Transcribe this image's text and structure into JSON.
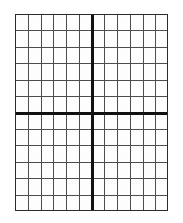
{
  "figure": {
    "kind": "blank-coordinate-grid",
    "background_color": "#ffffff",
    "plot_background_color": "#fdfdfd",
    "minor_gridline_color": "#4d4d4d",
    "axis_color": "#111111",
    "border_color": "#2b2b2b",
    "minor_gridline_width_px": 1,
    "axis_line_width_px": 2.6,
    "border_width_px": 1.4
  },
  "chart_data": {
    "type": "grid",
    "title": "",
    "subtitle": "",
    "xlabel": "",
    "ylabel": "",
    "columns": 12,
    "rows": 12,
    "xlim": [
      -6,
      6
    ],
    "ylim": [
      -6,
      6
    ],
    "x_tick_step": 1,
    "y_tick_step": 1,
    "x_ticks": [
      -6,
      -5,
      -4,
      -3,
      -2,
      -1,
      0,
      1,
      2,
      3,
      4,
      5,
      6
    ],
    "y_ticks": [
      -6,
      -5,
      -4,
      -3,
      -2,
      -1,
      0,
      1,
      2,
      3,
      4,
      5,
      6
    ],
    "x_tick_labels": [],
    "y_tick_labels": [],
    "grid": true,
    "legend": null,
    "legend_position": "none",
    "annotations": [],
    "series": [],
    "origin": {
      "x": 0,
      "y": 0
    },
    "axis_columns_from_left": 6,
    "axis_rows_from_top": 6,
    "show_axis_lines": true,
    "show_border": true
  },
  "plot_geometry": {
    "left_px": 15,
    "top_px": 14,
    "width_px": 153,
    "height_px": 197,
    "cell_width_px": 12.75,
    "cell_height_px": 16.42,
    "origin_x_px": 76.5,
    "origin_y_px": 98.5
  }
}
